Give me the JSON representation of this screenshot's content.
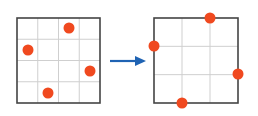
{
  "diagram": {
    "colors": {
      "grid_border": "#444444",
      "grid_line": "#cfcfcf",
      "dot": "#f0491f",
      "arrow": "#1f63b3"
    },
    "left_grid": {
      "cells": 4,
      "box": [
        17,
        18,
        100,
        103
      ],
      "dots": [
        [
          69,
          28
        ],
        [
          28,
          50
        ],
        [
          90,
          71
        ],
        [
          48,
          93
        ]
      ]
    },
    "arrow": {
      "from": [
        110,
        61
      ],
      "to": [
        146,
        61
      ]
    },
    "right_grid": {
      "cells": 3,
      "box": [
        154,
        18,
        238,
        103
      ],
      "dots": [
        [
          210,
          18
        ],
        [
          154,
          46
        ],
        [
          238,
          74
        ],
        [
          182,
          103
        ]
      ]
    }
  }
}
